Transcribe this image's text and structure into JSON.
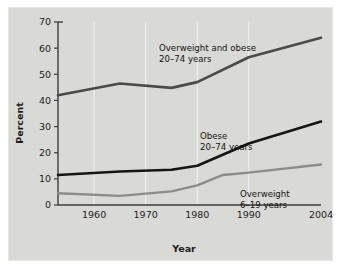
{
  "chart_data": {
    "type": "line",
    "title": "",
    "xlabel": "Year",
    "ylabel": "Percent",
    "xlim": [
      1953,
      2004
    ],
    "ylim": [
      0,
      70
    ],
    "xticks": [
      1960,
      1970,
      1980,
      1990,
      2004
    ],
    "xtick_labels": [
      "1960",
      "1970",
      "1980",
      "1990",
      "2004"
    ],
    "yticks": [
      0,
      10,
      20,
      30,
      40,
      50,
      60,
      70
    ],
    "ytick_labels": [
      "0",
      "10",
      "20",
      "30",
      "40",
      "50",
      "60",
      "70"
    ],
    "grid": "vertical-only",
    "legend_position": "inline-annotations",
    "series": [
      {
        "name": "Overweight and obese 20-74 years",
        "color": "#4a4a4a",
        "stroke_width": 2.6,
        "x": [
          1953,
          1965,
          1975,
          1980,
          1990,
          2004
        ],
        "values": [
          42.0,
          46.5,
          44.8,
          47.0,
          56.5,
          64.0
        ]
      },
      {
        "name": "Obese 20-74 years",
        "color": "#151515",
        "stroke_width": 2.6,
        "x": [
          1953,
          1965,
          1975,
          1980,
          1990,
          2004
        ],
        "values": [
          11.5,
          12.8,
          13.5,
          15.0,
          23.5,
          31.9
        ]
      },
      {
        "name": "Overweight 6-19 years",
        "color": "#8c8c8c",
        "stroke_width": 2.4,
        "x": [
          1953,
          1965,
          1975,
          1980,
          1985,
          1990,
          2004
        ],
        "values": [
          4.5,
          3.5,
          5.2,
          7.5,
          11.5,
          12.4,
          15.5
        ]
      }
    ],
    "annotations": [
      {
        "id": "annot-overweight-and-obese",
        "line1": "Overweight and obese",
        "line2": "20–74 years",
        "x_px": 150,
        "y_px": 43
      },
      {
        "id": "annot-obese",
        "line1": "Obese",
        "line2": "20–74 years",
        "x_px": 191,
        "y_px": 131
      },
      {
        "id": "annot-overweight",
        "line1": "Overweight",
        "line2": "6–19 years",
        "x_px": 231,
        "y_px": 189
      }
    ],
    "colors": {
      "background": "#d9d9d5",
      "frame": "#e6e6e4",
      "axis": "#3b3b3b",
      "gridline": "#f0f0ee",
      "text": "#1c1c1c"
    }
  }
}
